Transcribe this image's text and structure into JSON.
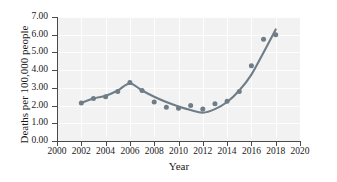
{
  "chart_data": {
    "type": "scatter",
    "title": "",
    "xlabel": "Year",
    "ylabel": "Deaths per 100,000 people",
    "xlim": [
      2000,
      2020
    ],
    "ylim": [
      0.0,
      7.0
    ],
    "xticks": [
      2000,
      2002,
      2004,
      2006,
      2008,
      2010,
      2012,
      2014,
      2016,
      2018,
      2020
    ],
    "xtick_labels": [
      "2000",
      "2002",
      "2004",
      "2006",
      "2008",
      "2010",
      "2012",
      "2014",
      "2016",
      "2018",
      "2020"
    ],
    "yticks": [
      0.0,
      1.0,
      2.0,
      3.0,
      4.0,
      5.0,
      6.0,
      7.0
    ],
    "ytick_labels": [
      "0.00",
      "1.00",
      "2.00",
      "3.00",
      "4.00",
      "5.00",
      "6.00",
      "7.00"
    ],
    "grid": true,
    "legend": null,
    "marker_color": "#6e7d87",
    "line_color": "#6e7d87",
    "plot_background": "#f2f2f2",
    "x": [
      2002,
      2003,
      2004,
      2005,
      2006,
      2007,
      2008,
      2009,
      2010,
      2011,
      2012,
      2013,
      2014,
      2015,
      2016,
      2017,
      2018
    ],
    "values": [
      2.15,
      2.4,
      2.5,
      2.8,
      3.3,
      2.85,
      2.2,
      1.9,
      1.85,
      2.0,
      1.8,
      2.1,
      2.25,
      2.8,
      4.25,
      5.75,
      6.0
    ],
    "points": [
      {
        "x": 2002,
        "y": 2.15
      },
      {
        "x": 2003,
        "y": 2.4
      },
      {
        "x": 2004,
        "y": 2.5
      },
      {
        "x": 2005,
        "y": 2.8
      },
      {
        "x": 2006,
        "y": 3.3
      },
      {
        "x": 2007,
        "y": 2.85
      },
      {
        "x": 2008,
        "y": 2.2
      },
      {
        "x": 2009,
        "y": 1.9
      },
      {
        "x": 2010,
        "y": 1.85
      },
      {
        "x": 2011,
        "y": 2.0
      },
      {
        "x": 2012,
        "y": 1.8
      },
      {
        "x": 2013,
        "y": 2.1
      },
      {
        "x": 2014,
        "y": 2.25
      },
      {
        "x": 2015,
        "y": 2.8
      },
      {
        "x": 2016,
        "y": 4.25
      },
      {
        "x": 2017,
        "y": 5.75
      },
      {
        "x": 2018,
        "y": 6.0
      }
    ],
    "fit_curve": {
      "name": "fitted trend line",
      "x": [
        2002,
        2003,
        2004,
        2005,
        2006,
        2007,
        2008,
        2009,
        2010,
        2011,
        2012,
        2013,
        2014,
        2015,
        2016,
        2017,
        2018
      ],
      "y": [
        2.15,
        2.4,
        2.55,
        2.85,
        3.25,
        2.85,
        2.5,
        2.2,
        1.95,
        1.75,
        1.6,
        1.8,
        2.2,
        2.85,
        3.75,
        5.0,
        6.3
      ]
    }
  }
}
